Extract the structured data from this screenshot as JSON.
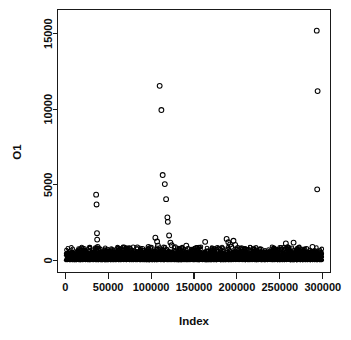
{
  "figure": {
    "kind": "r-base-scatter-plot",
    "background_color": "#ffffff",
    "foreground_color": "#000000",
    "point_symbol": "open-circle",
    "top_clipped_label": "20000"
  },
  "chart_data": {
    "type": "scatter",
    "title": "",
    "subtitle": "",
    "xlabel": "Index",
    "ylabel": "O1",
    "xlim": [
      -9000,
      309000
    ],
    "ylim": [
      -800,
      16600
    ],
    "grid": false,
    "legend": null,
    "xticks": [
      0,
      50000,
      100000,
      150000,
      200000,
      250000,
      300000
    ],
    "xtick_labels": [
      "0",
      "50000",
      "100000",
      "150000",
      "200000",
      "250000",
      "300000"
    ],
    "yticks": [
      0,
      5000,
      10000,
      15000
    ],
    "ytick_labels": [
      "0",
      "5000",
      "10000",
      "15000"
    ],
    "n_points_approx": 300000,
    "dense_band": {
      "x_from": 500,
      "x_to": 299500,
      "y_low": 10,
      "y_high": 620,
      "note": "solid black mass of ~300000 points hugging y=0"
    },
    "outliers": [
      {
        "x": 36000,
        "y": 4350
      },
      {
        "x": 36500,
        "y": 3700
      },
      {
        "x": 37000,
        "y": 1800
      },
      {
        "x": 37200,
        "y": 1380
      },
      {
        "x": 37800,
        "y": 900
      },
      {
        "x": 62000,
        "y": 780
      },
      {
        "x": 72000,
        "y": 700
      },
      {
        "x": 84000,
        "y": 860
      },
      {
        "x": 90000,
        "y": 760
      },
      {
        "x": 97000,
        "y": 900
      },
      {
        "x": 99000,
        "y": 820
      },
      {
        "x": 105000,
        "y": 1500
      },
      {
        "x": 107000,
        "y": 1250
      },
      {
        "x": 108000,
        "y": 980
      },
      {
        "x": 110000,
        "y": 11550
      },
      {
        "x": 112000,
        "y": 9950
      },
      {
        "x": 113500,
        "y": 5650
      },
      {
        "x": 116000,
        "y": 5050
      },
      {
        "x": 117500,
        "y": 4050
      },
      {
        "x": 119000,
        "y": 2850
      },
      {
        "x": 119500,
        "y": 2550
      },
      {
        "x": 121000,
        "y": 1650
      },
      {
        "x": 122500,
        "y": 1180
      },
      {
        "x": 124000,
        "y": 1000
      },
      {
        "x": 128000,
        "y": 880
      },
      {
        "x": 133000,
        "y": 700
      },
      {
        "x": 141000,
        "y": 980
      },
      {
        "x": 143000,
        "y": 760
      },
      {
        "x": 152000,
        "y": 800
      },
      {
        "x": 163000,
        "y": 1230
      },
      {
        "x": 176000,
        "y": 700
      },
      {
        "x": 188000,
        "y": 1420
      },
      {
        "x": 190000,
        "y": 1200
      },
      {
        "x": 192000,
        "y": 1060
      },
      {
        "x": 193500,
        "y": 900
      },
      {
        "x": 196000,
        "y": 1300
      },
      {
        "x": 198000,
        "y": 1020
      },
      {
        "x": 201000,
        "y": 820
      },
      {
        "x": 214000,
        "y": 700
      },
      {
        "x": 228000,
        "y": 720
      },
      {
        "x": 243000,
        "y": 760
      },
      {
        "x": 257000,
        "y": 1120
      },
      {
        "x": 259000,
        "y": 880
      },
      {
        "x": 266000,
        "y": 1180
      },
      {
        "x": 272000,
        "y": 820
      },
      {
        "x": 281000,
        "y": 760
      },
      {
        "x": 288000,
        "y": 900
      },
      {
        "x": 293000,
        "y": 15200
      },
      {
        "x": 294000,
        "y": 11200
      },
      {
        "x": 293500,
        "y": 4700
      }
    ]
  }
}
